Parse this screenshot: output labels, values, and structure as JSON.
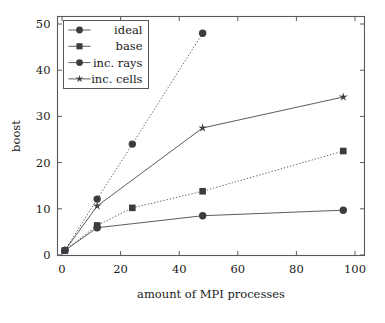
{
  "chart_data": {
    "type": "line",
    "title": "",
    "xlabel": "amount of MPI processes",
    "ylabel": "boost",
    "xlim": [
      -4,
      104
    ],
    "ylim": [
      -2,
      52
    ],
    "xticks": [
      0,
      20,
      40,
      60,
      80,
      100
    ],
    "yticks": [
      0,
      10,
      20,
      30,
      40,
      50
    ],
    "grid": false,
    "legend_position": "top-left",
    "series": [
      {
        "name": "ideal",
        "marker": "circle",
        "linestyle": "dotted",
        "x": [
          1,
          12,
          24,
          48
        ],
        "y": [
          1,
          12.1,
          24.0,
          48.0
        ]
      },
      {
        "name": "base",
        "marker": "square",
        "linestyle": "dotted",
        "x": [
          1,
          12,
          24,
          48,
          96
        ],
        "y": [
          1,
          6.4,
          10.2,
          13.8,
          22.5
        ]
      },
      {
        "name": "inc. rays",
        "marker": "circle",
        "linestyle": "solid",
        "x": [
          1,
          12,
          48,
          96
        ],
        "y": [
          1,
          5.9,
          8.5,
          9.7
        ]
      },
      {
        "name": "inc. cells",
        "marker": "star",
        "linestyle": "solid",
        "x": [
          1,
          12,
          48,
          96
        ],
        "y": [
          1,
          10.6,
          27.5,
          34.2
        ]
      }
    ]
  },
  "axis": {
    "x_tick_labels": [
      "0",
      "20",
      "40",
      "60",
      "80",
      "100"
    ],
    "y_tick_labels": [
      "0",
      "10",
      "20",
      "30",
      "40",
      "50"
    ],
    "x_title": "amount of MPI processes",
    "y_title": "boost"
  },
  "legend": {
    "entries": [
      {
        "label": "ideal",
        "marker": "circle"
      },
      {
        "label": "base",
        "marker": "square"
      },
      {
        "label": "inc. rays",
        "marker": "circle"
      },
      {
        "label": "inc. cells",
        "marker": "star"
      }
    ]
  },
  "colors": {
    "line": "#3d3f42",
    "marker": "#3a3c3f",
    "axis": "#55585c",
    "text": "#1a1a1a",
    "background": "#ffffff"
  }
}
